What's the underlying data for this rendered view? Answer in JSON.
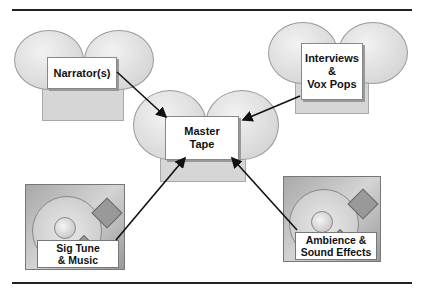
{
  "diagram": {
    "title": "",
    "nodes": {
      "narrators": {
        "label": "Narrator(s)",
        "kind": "tape-deck"
      },
      "interviews": {
        "label": "Interviews\n&\nVox Pops",
        "kind": "tape-deck"
      },
      "master": {
        "label": "Master\nTape",
        "kind": "tape-deck"
      },
      "sig_tune": {
        "label": "Sig Tune\n& Music",
        "kind": "record-player"
      },
      "ambience": {
        "label": "Ambience &\nSound Effects",
        "kind": "record-player"
      }
    },
    "edges": [
      {
        "from": "narrators",
        "to": "master"
      },
      {
        "from": "interviews",
        "to": "master"
      },
      {
        "from": "sig_tune",
        "to": "master"
      },
      {
        "from": "ambience",
        "to": "master"
      }
    ]
  }
}
